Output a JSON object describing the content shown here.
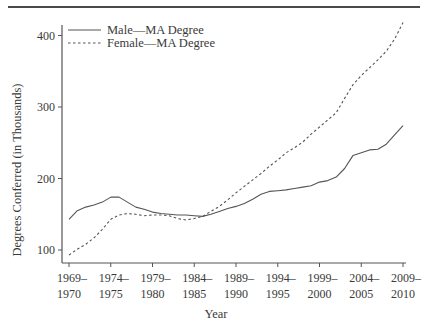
{
  "chart_data": {
    "type": "line",
    "title": "",
    "xlabel": "Year",
    "ylabel": "Degrees Conferred (in Thousands)",
    "ylim": [
      85,
      420
    ],
    "yticks": [
      100,
      200,
      300,
      400
    ],
    "xticks": [
      {
        "year": 1969,
        "line1": "1969–",
        "line2": "1970"
      },
      {
        "year": 1974,
        "line1": "1974–",
        "line2": "1975"
      },
      {
        "year": 1979,
        "line1": "1979–",
        "line2": "1980"
      },
      {
        "year": 1984,
        "line1": "1984–",
        "line2": "1985"
      },
      {
        "year": 1989,
        "line1": "1989–",
        "line2": "1990"
      },
      {
        "year": 1994,
        "line1": "1994–",
        "line2": "1995"
      },
      {
        "year": 1999,
        "line1": "1999–",
        "line2": "2000"
      },
      {
        "year": 2004,
        "line1": "2004–",
        "line2": "2005"
      },
      {
        "year": 2009,
        "line1": "2009–",
        "line2": "2010"
      }
    ],
    "grid": false,
    "legend_position": "top-left",
    "x": [
      1969,
      1970,
      1971,
      1972,
      1973,
      1974,
      1975,
      1976,
      1977,
      1978,
      1979,
      1980,
      1981,
      1982,
      1983,
      1984,
      1985,
      1986,
      1987,
      1988,
      1989,
      1990,
      1991,
      1992,
      1993,
      1994,
      1995,
      1996,
      1997,
      1998,
      1999,
      2000,
      2001,
      2002,
      2003,
      2004,
      2005,
      2006,
      2007,
      2008,
      2009
    ],
    "series": [
      {
        "name": "Male—MA Degree",
        "style": "solid",
        "color": "#555555",
        "values": [
          143,
          155,
          160,
          163,
          167,
          174,
          174,
          167,
          160,
          157,
          153,
          151,
          150,
          149,
          149,
          148,
          147,
          150,
          154,
          158,
          161,
          165,
          171,
          178,
          182,
          183,
          184,
          186,
          188,
          190,
          195,
          197,
          202,
          214,
          232,
          236,
          240,
          241,
          248,
          261,
          274
        ]
      },
      {
        "name": "Female—MA Degree",
        "style": "dashed",
        "color": "#555555",
        "values": [
          93,
          101,
          108,
          117,
          129,
          143,
          149,
          151,
          150,
          148,
          149,
          149,
          148,
          144,
          142,
          144,
          147,
          154,
          161,
          170,
          180,
          189,
          198,
          207,
          217,
          226,
          236,
          243,
          251,
          262,
          272,
          282,
          292,
          312,
          331,
          344,
          355,
          366,
          378,
          395,
          418
        ]
      }
    ]
  }
}
